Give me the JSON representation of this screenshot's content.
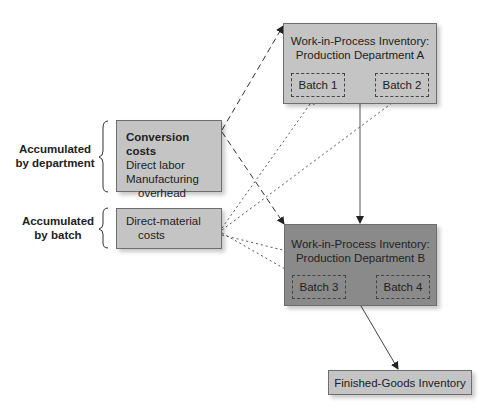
{
  "diagram": {
    "wip_a": {
      "title_line1": "Work-in-Process Inventory:",
      "title_line2": "Production Department A",
      "batches": [
        "Batch 1",
        "Batch 2"
      ]
    },
    "wip_b": {
      "title_line1": "Work-in-Process Inventory:",
      "title_line2": "Production Department B",
      "batches": [
        "Batch 3",
        "Batch 4"
      ]
    },
    "conversion_costs": {
      "heading": "Conversion costs",
      "line1": "Direct labor",
      "line2": "Manufacturing",
      "line3": "overhead"
    },
    "direct_material": {
      "line1": "Direct-material",
      "line2": "costs"
    },
    "finished_goods": {
      "label": "Finished-Goods Inventory"
    },
    "side_labels": {
      "by_department_line1": "Accumulated",
      "by_department_line2": "by department",
      "by_batch_line1": "Accumulated",
      "by_batch_line2": "by batch"
    },
    "colors": {
      "light_box": "#c4c4c4",
      "dark_box": "#8a8a8a",
      "line": "#333333"
    }
  }
}
